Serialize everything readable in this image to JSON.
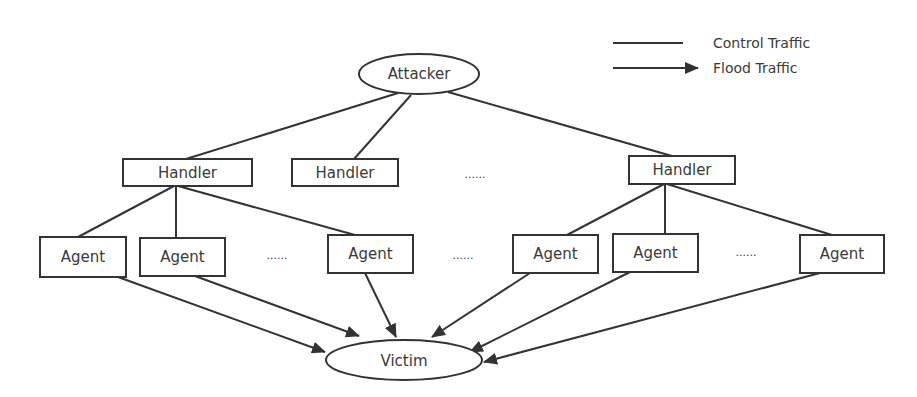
{
  "legend": {
    "control": {
      "label": "Control Traffic"
    },
    "flood": {
      "label": "Flood Traffic"
    }
  },
  "nodes": {
    "attacker": {
      "label": "Attacker"
    },
    "handlers": [
      {
        "label": "Handler"
      },
      {
        "label": "Handler"
      },
      {
        "label": "Handler"
      }
    ],
    "agents": [
      {
        "label": "Agent"
      },
      {
        "label": "Agent"
      },
      {
        "label": "Agent"
      },
      {
        "label": "Agent"
      },
      {
        "label": "Agent"
      },
      {
        "label": "Agent"
      }
    ],
    "victim": {
      "label": "Victim"
    }
  },
  "ellipsis": {
    "handlers_row": "......",
    "agents_left": "......",
    "agents_middle": "......",
    "agents_right": "......"
  },
  "edges": {
    "control": [
      [
        "Attacker",
        "Handler 1"
      ],
      [
        "Attacker",
        "Handler 2"
      ],
      [
        "Attacker",
        "Handler 3"
      ],
      [
        "Handler 1",
        "Agent 1"
      ],
      [
        "Handler 1",
        "Agent 2"
      ],
      [
        "Handler 1",
        "Agent 3"
      ],
      [
        "Handler 3",
        "Agent 4"
      ],
      [
        "Handler 3",
        "Agent 5"
      ],
      [
        "Handler 3",
        "Agent 6"
      ]
    ],
    "flood": [
      [
        "Agent 1",
        "Victim"
      ],
      [
        "Agent 2",
        "Victim"
      ],
      [
        "Agent 3",
        "Victim"
      ],
      [
        "Agent 4",
        "Victim"
      ],
      [
        "Agent 5",
        "Victim"
      ],
      [
        "Agent 6",
        "Victim"
      ]
    ]
  }
}
